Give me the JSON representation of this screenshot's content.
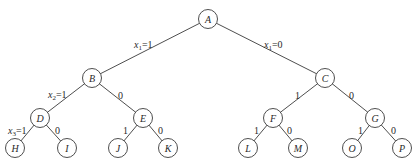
{
  "diagram": {
    "type": "binary-decision-tree",
    "nodes": [
      {
        "id": "A",
        "label": "A",
        "x": 208,
        "y": 19
      },
      {
        "id": "B",
        "label": "B",
        "x": 92,
        "y": 78
      },
      {
        "id": "C",
        "label": "C",
        "x": 325,
        "y": 78
      },
      {
        "id": "D",
        "label": "D",
        "x": 40,
        "y": 118
      },
      {
        "id": "E",
        "label": "E",
        "x": 143,
        "y": 118
      },
      {
        "id": "F",
        "label": "F",
        "x": 273,
        "y": 118
      },
      {
        "id": "G",
        "label": "G",
        "x": 375,
        "y": 118
      },
      {
        "id": "H",
        "label": "H",
        "x": 15,
        "y": 148
      },
      {
        "id": "I",
        "label": "I",
        "x": 67,
        "y": 148
      },
      {
        "id": "J",
        "label": "J",
        "x": 118,
        "y": 148
      },
      {
        "id": "K",
        "label": "K",
        "x": 168,
        "y": 148
      },
      {
        "id": "L",
        "label": "L",
        "x": 248,
        "y": 148
      },
      {
        "id": "M",
        "label": "M",
        "x": 298,
        "y": 148
      },
      {
        "id": "O",
        "label": "O",
        "x": 352,
        "y": 148
      },
      {
        "id": "P",
        "label": "P",
        "x": 402,
        "y": 148
      }
    ],
    "edges": [
      {
        "from": "A",
        "to": "B",
        "label": {
          "var": "x",
          "sub": "1",
          "val": "=1"
        },
        "lx": 134,
        "ly": 48
      },
      {
        "from": "A",
        "to": "C",
        "label": {
          "var": "x",
          "sub": "1",
          "val": "=0"
        },
        "lx": 264,
        "ly": 48
      },
      {
        "from": "B",
        "to": "D",
        "label": {
          "var": "x",
          "sub": "2",
          "val": "=1"
        },
        "lx": 48,
        "ly": 98
      },
      {
        "from": "B",
        "to": "E",
        "label": {
          "var": "",
          "sub": "",
          "val": "0"
        },
        "lx": 118,
        "ly": 99
      },
      {
        "from": "C",
        "to": "F",
        "label": {
          "var": "",
          "sub": "",
          "val": "1"
        },
        "lx": 295,
        "ly": 99
      },
      {
        "from": "C",
        "to": "G",
        "label": {
          "var": "",
          "sub": "",
          "val": "0"
        },
        "lx": 349,
        "ly": 99
      },
      {
        "from": "D",
        "to": "H",
        "label": {
          "var": "x",
          "sub": "3",
          "val": "=1"
        },
        "lx": 8,
        "ly": 134
      },
      {
        "from": "D",
        "to": "I",
        "label": {
          "var": "",
          "sub": "",
          "val": "0"
        },
        "lx": 55,
        "ly": 134
      },
      {
        "from": "E",
        "to": "J",
        "label": {
          "var": "",
          "sub": "",
          "val": "1"
        },
        "lx": 123,
        "ly": 134
      },
      {
        "from": "E",
        "to": "K",
        "label": {
          "var": "",
          "sub": "",
          "val": "0"
        },
        "lx": 158,
        "ly": 134
      },
      {
        "from": "F",
        "to": "L",
        "label": {
          "var": "",
          "sub": "",
          "val": "1"
        },
        "lx": 254,
        "ly": 134
      },
      {
        "from": "F",
        "to": "M",
        "label": {
          "var": "",
          "sub": "",
          "val": "0"
        },
        "lx": 287,
        "ly": 134
      },
      {
        "from": "G",
        "to": "O",
        "label": {
          "var": "",
          "sub": "",
          "val": "1"
        },
        "lx": 358,
        "ly": 134
      },
      {
        "from": "G",
        "to": "P",
        "label": {
          "var": "",
          "sub": "",
          "val": "0"
        },
        "lx": 391,
        "ly": 134
      }
    ],
    "node_radius": 9.5,
    "colors": {
      "stroke": "#3a3a3a",
      "text": "#2a2a2a",
      "background": "#ffffff"
    }
  }
}
